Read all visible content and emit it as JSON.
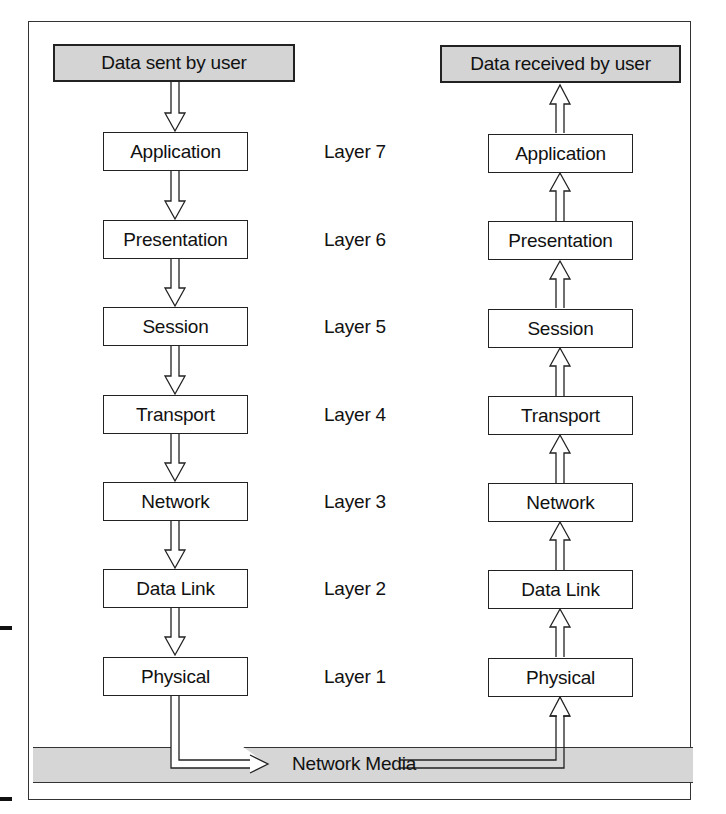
{
  "diagram": {
    "sender": {
      "label": "Data sent by user"
    },
    "receiver": {
      "label": "Data received by user"
    },
    "layers": [
      {
        "name": "Application",
        "label": "Layer 7"
      },
      {
        "name": "Presentation",
        "label": "Layer 6"
      },
      {
        "name": "Session",
        "label": "Layer 5"
      },
      {
        "name": "Transport",
        "label": "Layer 4"
      },
      {
        "name": "Network",
        "label": "Layer 3"
      },
      {
        "name": "Data Link",
        "label": "Layer 2"
      },
      {
        "name": "Physical",
        "label": "Layer 1"
      }
    ],
    "media": {
      "label": "Network Media"
    },
    "colors": {
      "gray_fill": "#d4d4d4",
      "line": "#222222",
      "background": "#ffffff"
    }
  }
}
